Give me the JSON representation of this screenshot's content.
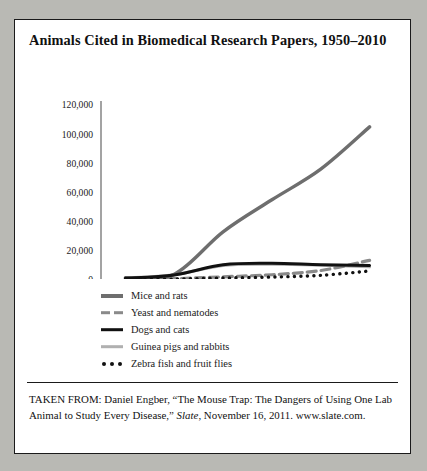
{
  "figure": {
    "title": "Animals Cited in Biomedical Research Papers, 1950–2010",
    "caption_line1": "TAKEN FROM: Daniel Engber, “The Mouse Trap: The Dangers of",
    "caption_line2_a": "Using One Lab Animal to Study Every Disease,” ",
    "caption_line2_italic": "Slate",
    "caption_line2_b": ", November 16,",
    "caption_line3": "2011. www.slate.com."
  },
  "chart_data": {
    "type": "line",
    "title": "Animals Cited in Biomedical Research Papers, 1950–2010",
    "xlabel": "",
    "ylabel": "",
    "categories": [
      "1950s",
      "1960s",
      "1970s",
      "1980s",
      "1990s",
      "2000s"
    ],
    "x": [
      "1950s",
      "1960s",
      "1970s",
      "1980s",
      "1990s",
      "2000s"
    ],
    "ylim": [
      0,
      120000
    ],
    "ytick_values": [
      0,
      20000,
      40000,
      60000,
      80000,
      100000,
      120000
    ],
    "ytick_labels": [
      "0",
      "20,000",
      "40,000",
      "60,000",
      "80,000",
      "100,000",
      "120,000"
    ],
    "grid": false,
    "legend_position": "below-left",
    "series": [
      {
        "name": "Mice and rats",
        "style": "solid",
        "color": "#6e6e6e",
        "width": 3.4,
        "values": [
          1500,
          4000,
          33000,
          55000,
          76000,
          105000
        ]
      },
      {
        "name": "Yeast and nematodes",
        "style": "dashed",
        "color": "#8a8a8a",
        "width": 3.2,
        "values": [
          500,
          900,
          2200,
          3600,
          6500,
          13500
        ]
      },
      {
        "name": "Dogs and cats",
        "style": "solid",
        "color": "#111111",
        "width": 3.0,
        "values": [
          1200,
          3500,
          10500,
          11500,
          10500,
          10000
        ]
      },
      {
        "name": "Guinea pigs and rabbits",
        "style": "solid",
        "color": "#b0b0b0",
        "width": 3.0,
        "values": [
          1300,
          3600,
          10000,
          10800,
          10200,
          9000
        ]
      },
      {
        "name": "Zebra fish and fruit flies",
        "style": "dotted",
        "color": "#111111",
        "width": 3.4,
        "values": [
          300,
          600,
          1400,
          2000,
          3200,
          6200
        ]
      }
    ]
  }
}
